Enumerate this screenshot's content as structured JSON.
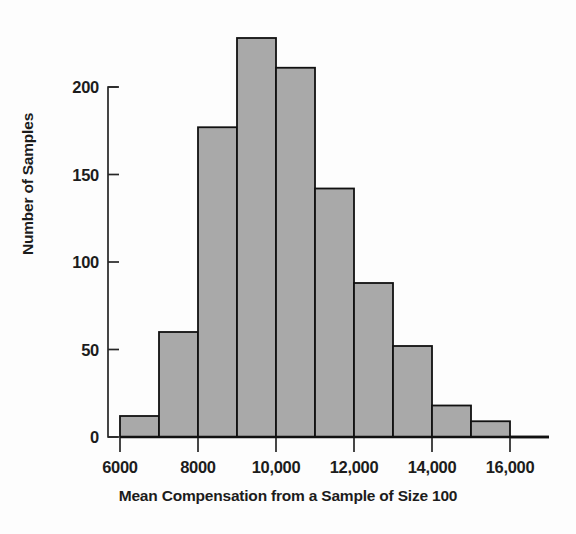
{
  "chart_data": {
    "type": "bar",
    "title": "",
    "subtitle": "",
    "xlabel": "Mean Compensation from a Sample of Size 100",
    "ylabel": "Number of Samples",
    "xlim": [
      6000,
      17000
    ],
    "ylim": [
      0,
      235
    ],
    "grid": false,
    "legend": null,
    "bin_width": 1000,
    "bar_fill_color": "#a9a9a9",
    "bar_edge_color": "#111111",
    "axis_color": "#262626",
    "background_color": "#fdfdfd",
    "xticks": [
      6000,
      8000,
      10000,
      12000,
      14000,
      16000
    ],
    "xtick_labels": [
      "6000",
      "8000",
      "10,000",
      "12,000",
      "14,000",
      "16,000"
    ],
    "yticks": [
      0,
      50,
      100,
      150,
      200
    ],
    "ytick_labels": [
      "0",
      "50",
      "100",
      "150",
      "200"
    ],
    "bin_edges": [
      6000,
      7000,
      8000,
      9000,
      10000,
      11000,
      12000,
      13000,
      14000,
      15000,
      16000,
      17000
    ],
    "categories": [
      "6000-7000",
      "7000-8000",
      "8000-9000",
      "9000-10,000",
      "10,000-11,000",
      "11,000-12,000",
      "12,000-13,000",
      "13,000-14,000",
      "14,000-15,000",
      "15,000-16,000",
      "16,000-17,000"
    ],
    "values": [
      12,
      60,
      177,
      228,
      211,
      142,
      88,
      52,
      18,
      9,
      0
    ]
  },
  "figure": {
    "y_axis_title": "Number of Samples",
    "x_axis_title": "Mean Compensation from a Sample of Size 100"
  }
}
